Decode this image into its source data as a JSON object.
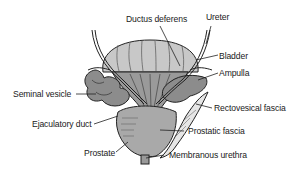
{
  "diagram": {
    "labels": [
      {
        "id": "ductus-deferens",
        "text": "Ductus deferens"
      },
      {
        "id": "ureter",
        "text": "Ureter"
      },
      {
        "id": "bladder",
        "text": "Bladder"
      },
      {
        "id": "ampulla",
        "text": "Ampulla"
      },
      {
        "id": "seminal-vesicle",
        "text": "Seminal vesicle"
      },
      {
        "id": "rectovesical-fascia",
        "text": "Rectovesical fascia"
      },
      {
        "id": "ejaculatory-duct",
        "text": "Ejaculatory duct"
      },
      {
        "id": "prostatic-fascia",
        "text": "Prostatic fascia"
      },
      {
        "id": "prostate",
        "text": "Prostate"
      },
      {
        "id": "membranous-urethra",
        "text": "Membranous urethra"
      }
    ]
  },
  "colors": {
    "background": "#ffffff",
    "outline": "#222222",
    "bladder_fill": "#c8c8c8",
    "prostate_fill": "#a9a9a9",
    "fascia_fill": "#e6e6e6",
    "vesicle_fill": "#8c8c8c"
  }
}
